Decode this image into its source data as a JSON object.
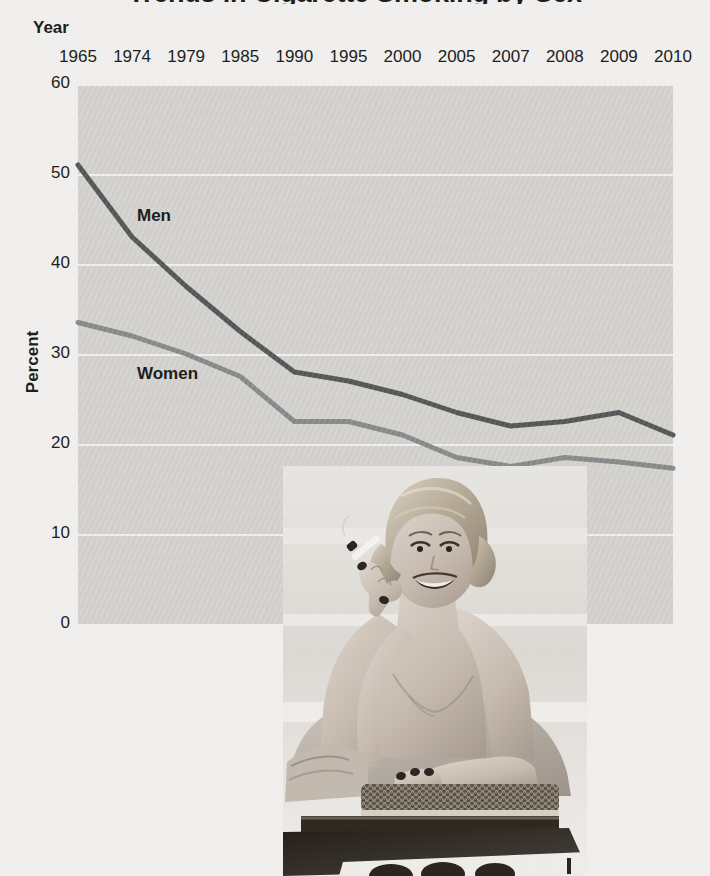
{
  "chart_data": {
    "type": "line",
    "title": "Trends in Cigarette Smoking by Sex",
    "xlabel": "Year",
    "ylabel": "Percent",
    "categories": [
      "1965",
      "1974",
      "1979",
      "1985",
      "1990",
      "1995",
      "2000",
      "2005",
      "2007",
      "2008",
      "2009",
      "2010"
    ],
    "series": [
      {
        "name": "Men",
        "color": "#58585a",
        "values": [
          51.0,
          43.0,
          37.5,
          32.5,
          28.0,
          27.0,
          25.5,
          23.5,
          22.0,
          22.5,
          23.5,
          21.0
        ]
      },
      {
        "name": "Women",
        "color": "#8c8c8e",
        "values": [
          33.5,
          32.0,
          30.0,
          27.5,
          22.5,
          22.5,
          21.0,
          18.5,
          17.5,
          18.5,
          18.0,
          17.3
        ]
      }
    ],
    "ylim": [
      0,
      60
    ],
    "yticks": [
      "0",
      "10",
      "20",
      "30",
      "40",
      "50",
      "60"
    ],
    "grid": true,
    "legend_position": "inline-labels",
    "plot_background": "#d6d5d2",
    "page_background": "#f2f1ef"
  },
  "annotations": {
    "series_label_men": "Men",
    "series_label_women": "Women"
  },
  "photo": {
    "caption": "vintage photo of a smiling woman holding a cigarette, seated at a table"
  }
}
